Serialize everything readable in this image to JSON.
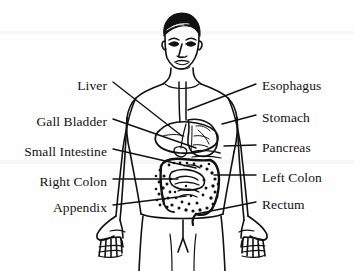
{
  "figure": {
    "background_color": "#fefefe",
    "ink_color": "#111111"
  },
  "labels": {
    "left": [
      {
        "id": "liver",
        "text": "Liver",
        "text_x": 107,
        "text_y": 86,
        "line": [
          [
            113,
            82
          ],
          [
            182,
            136
          ]
        ]
      },
      {
        "id": "gall-bladder",
        "text": "Gall Bladder",
        "text_x": 107,
        "text_y": 122,
        "line": [
          [
            113,
            119
          ],
          [
            196,
            148
          ]
        ]
      },
      {
        "id": "small-intestine",
        "text": "Small Intestine",
        "text_x": 107,
        "text_y": 152,
        "line": [
          [
            113,
            149
          ],
          [
            196,
            168
          ]
        ]
      },
      {
        "id": "right-colon",
        "text": "Right Colon",
        "text_x": 107,
        "text_y": 182,
        "line": [
          [
            113,
            179
          ],
          [
            178,
            179
          ]
        ]
      },
      {
        "id": "appendix",
        "text": "Appendix",
        "text_x": 107,
        "text_y": 208,
        "line": [
          [
            113,
            205
          ],
          [
            186,
            196
          ]
        ]
      }
    ],
    "right": [
      {
        "id": "esophagus",
        "text": "Esophagus",
        "text_x": 262,
        "text_y": 86,
        "line": [
          [
            256,
            84
          ],
          [
            188,
            110
          ]
        ]
      },
      {
        "id": "stomach",
        "text": "Stomach",
        "text_x": 262,
        "text_y": 118,
        "line": [
          [
            256,
            115
          ],
          [
            222,
            124
          ]
        ]
      },
      {
        "id": "pancreas",
        "text": "Pancreas",
        "text_x": 262,
        "text_y": 148,
        "line": [
          [
            256,
            145
          ],
          [
            224,
            146
          ]
        ]
      },
      {
        "id": "left-colon",
        "text": "Left Colon",
        "text_x": 262,
        "text_y": 178,
        "line": [
          [
            256,
            175
          ],
          [
            214,
            175
          ]
        ]
      },
      {
        "id": "rectum",
        "text": "Rectum",
        "text_x": 262,
        "text_y": 205,
        "line": [
          [
            256,
            202
          ],
          [
            196,
            214
          ]
        ]
      }
    ]
  },
  "organs": [
    {
      "id": "esophagus-tube",
      "name": "esophagus"
    },
    {
      "id": "stomach-body",
      "name": "stomach"
    },
    {
      "id": "liver-lobe",
      "name": "liver"
    },
    {
      "id": "gall-bladder-sac",
      "name": "gall bladder"
    },
    {
      "id": "pancreas-body",
      "name": "pancreas"
    },
    {
      "id": "colon-loop",
      "name": "colon"
    },
    {
      "id": "small-intestine-mass",
      "name": "small intestine"
    },
    {
      "id": "appendix-tip",
      "name": "appendix"
    },
    {
      "id": "rectum-tube",
      "name": "rectum"
    }
  ],
  "body": {
    "view": "anterior",
    "parts": [
      "head",
      "neck",
      "shoulders",
      "torso",
      "arms",
      "hands",
      "hips",
      "legs"
    ]
  }
}
